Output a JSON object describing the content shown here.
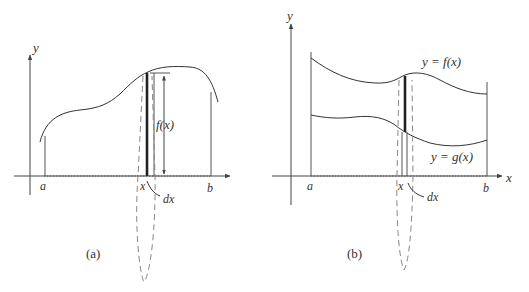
{
  "panels": [
    {
      "id": "a",
      "caption": "(a)",
      "y_axis_label": "y",
      "x_labels": {
        "a": "a",
        "x": "x",
        "b": "b"
      },
      "height_label": "f(x)",
      "width_label": "dx",
      "description": "Area under the curve y = f(x) from a to b, with a representative vertical strip of height f(x) and width dx"
    },
    {
      "id": "b",
      "caption": "(b)",
      "y_axis_label": "y",
      "x_axis_label": "x",
      "x_labels": {
        "a": "a",
        "x": "x",
        "b": "b"
      },
      "upper_curve_label": "y = f(x)",
      "lower_curve_label": "y = g(x)",
      "width_label": "dx",
      "description": "Area between curves y = f(x) and y = g(x) from a to b, with a representative vertical strip of width dx"
    }
  ]
}
